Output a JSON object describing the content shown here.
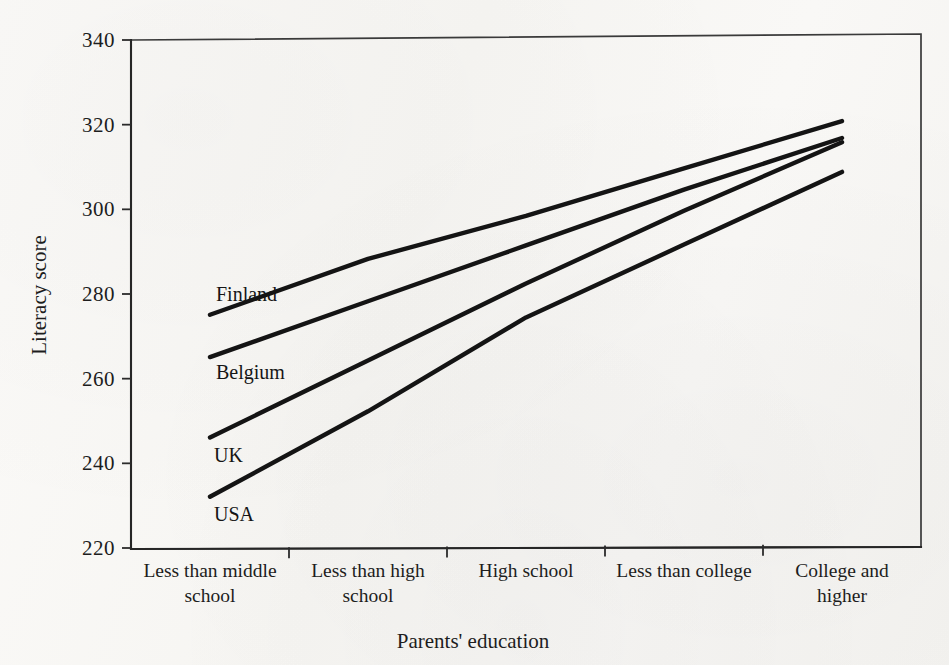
{
  "chart_data": {
    "type": "line",
    "title": "",
    "subtitle": "",
    "xlabel": "Parents' education",
    "ylabel": "Literacy score",
    "categories": [
      "Less than middle school",
      "Less than high school",
      "High school",
      "Less than college",
      "College and higher"
    ],
    "category_lines": [
      [
        "Less than middle",
        "school"
      ],
      [
        "Less than high",
        "school"
      ],
      [
        "High school"
      ],
      [
        "Less than college"
      ],
      [
        "College and",
        "higher"
      ]
    ],
    "ylim": [
      220,
      340
    ],
    "yticks": [
      220,
      240,
      260,
      280,
      300,
      320,
      340
    ],
    "ytick_labels": [
      "220",
      "240",
      "260",
      "280",
      "300",
      "320",
      "340"
    ],
    "grid": false,
    "legend_position": "inline-left-of-line-start",
    "series": [
      {
        "name": "Finland",
        "values": [
          275,
          288,
          298,
          309,
          320
        ],
        "color": "#141414"
      },
      {
        "name": "Belgium",
        "values": [
          265,
          278,
          291,
          304,
          316
        ],
        "color": "#141414"
      },
      {
        "name": "UK",
        "values": [
          246,
          264,
          282,
          299,
          315
        ],
        "color": "#141414"
      },
      {
        "name": "USA",
        "values": [
          232,
          252,
          274,
          291,
          308
        ],
        "color": "#141414"
      }
    ],
    "series_label_order": [
      "Finland",
      "Belgium",
      "UK",
      "USA"
    ]
  },
  "figure": {
    "background_color": "#f8f7f4",
    "ink_color": "#141414",
    "frame_color": "#3a3a3a"
  }
}
